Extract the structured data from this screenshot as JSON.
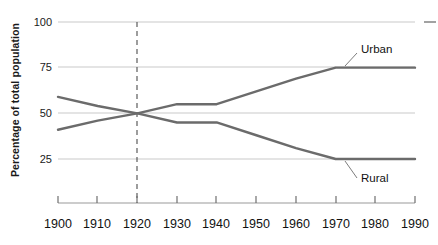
{
  "chart_data": {
    "type": "line",
    "title": "",
    "xlabel": "",
    "ylabel": "Percentage of total population",
    "x": [
      1900,
      1910,
      1920,
      1930,
      1940,
      1950,
      1960,
      1970,
      1980,
      1990
    ],
    "xtick_labels": [
      "1900",
      "1910",
      "1920",
      "1930",
      "1940",
      "1950",
      "1960",
      "1970",
      "1980",
      "1990"
    ],
    "ytick_labels": [
      "100",
      "75",
      "50",
      "25"
    ],
    "yticks": [
      100,
      75,
      50,
      25
    ],
    "xlim": [
      1900,
      1990
    ],
    "ylim": [
      0,
      100
    ],
    "grid": true,
    "grid_axis": "y",
    "legend": "inline-annotations",
    "series": [
      {
        "name": "Urban",
        "label": "Urban",
        "color": "#6b6b6b",
        "values": [
          41,
          46,
          50,
          55,
          55,
          62,
          69,
          75,
          75,
          75
        ]
      },
      {
        "name": "Rural",
        "label": "Rural",
        "color": "#6b6b6b",
        "values": [
          59,
          54,
          50,
          45,
          45,
          38,
          31,
          25,
          25,
          25
        ]
      }
    ],
    "annotations": [
      {
        "text": "Urban",
        "series": "Urban",
        "at_x": 1972,
        "leader": true
      },
      {
        "text": "Rural",
        "series": "Rural",
        "at_x": 1972,
        "leader": true
      }
    ],
    "reference_line": {
      "orientation": "vertical",
      "x": 1920,
      "style": "dashed",
      "color": "#4d4d4d"
    }
  },
  "colors": {
    "line": "#6b6b6b",
    "grid": "#c9c9c9",
    "axis": "#8a8a8a",
    "text": "#1a1a1a",
    "dashed": "#4d4d4d",
    "background": "#ffffff"
  }
}
